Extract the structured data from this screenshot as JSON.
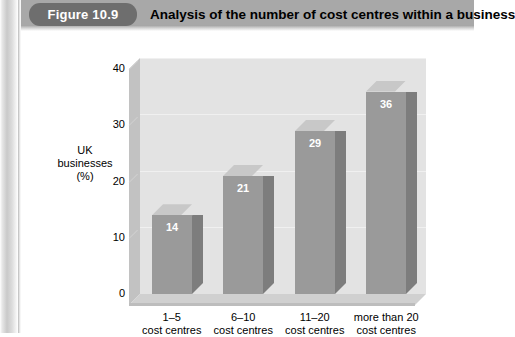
{
  "figure": {
    "tag": "Figure 10.9",
    "title": "Analysis of the number of cost centres within a business"
  },
  "colors": {
    "header_band": "#a8a8a8",
    "pill": "#6e6e6e",
    "pill_text": "#ffffff",
    "plot_background": "#e3e3e3",
    "bar_front": "#9a9a9a",
    "bar_top": "#c8c8c8",
    "bar_side": "#7d7d7d",
    "value_label": "#ffffff"
  },
  "chart_data": {
    "type": "bar",
    "title": "Analysis of the number of cost centres within a business",
    "xlabel": "",
    "ylabel": "UK businesses (%)",
    "ylabel_lines": [
      "UK",
      "businesses",
      "(%)"
    ],
    "categories": [
      "1–5 cost centres",
      "6–10 cost centres",
      "11–20 cost centres",
      "more than 20 cost centres"
    ],
    "category_lines": [
      [
        "1–5",
        "cost centres"
      ],
      [
        "6–10",
        "cost centres"
      ],
      [
        "11–20",
        "cost centres"
      ],
      [
        "more than 20",
        "cost centres"
      ]
    ],
    "values": [
      14,
      21,
      29,
      36
    ],
    "value_labels": [
      "14",
      "21",
      "29",
      "36"
    ],
    "ylim": [
      0,
      40
    ],
    "yticks": [
      0,
      10,
      20,
      30,
      40
    ],
    "ytick_labels": [
      "0",
      "10",
      "20",
      "30",
      "40"
    ],
    "grid": true,
    "legend": false,
    "three_d": true
  }
}
